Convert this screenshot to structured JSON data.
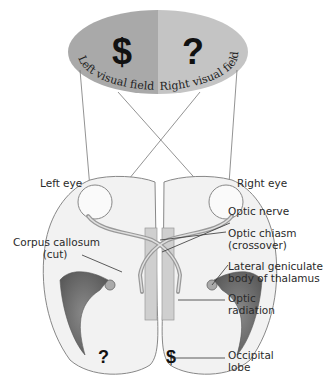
{
  "visual_field": {
    "left_symbol": "$",
    "right_symbol": "?",
    "left_label": "Left visual field",
    "right_label": "Right visual field",
    "left_color": "#a9a9a9",
    "right_color": "#c4c4c4"
  },
  "labels": {
    "left_eye": "Left eye",
    "right_eye": "Right eye",
    "optic_nerve": "Optic nerve",
    "optic_chiasm_line1": "Optic chiasm",
    "optic_chiasm_line2": "(crossover)",
    "corpus_callosum_line1": "Corpus callosum",
    "corpus_callosum_line2": "(cut)",
    "lgn_line1": "Lateral geniculate",
    "lgn_line2": "body of thalamus",
    "optic_radiation_line1": "Optic",
    "optic_radiation_line2": "radiation",
    "occipital_line1": "Occipital",
    "occipital_line2": "lobe"
  },
  "cortex_symbols": {
    "left_hemisphere": "?",
    "right_hemisphere": "$"
  }
}
